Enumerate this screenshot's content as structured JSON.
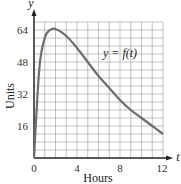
{
  "chart_data": {
    "type": "line",
    "title": "",
    "xlabel": "Hours",
    "ylabel": "Units",
    "x_axis_var": "t",
    "y_axis_var": "y",
    "curve_label": "y = f(t)",
    "xlim": [
      0,
      12
    ],
    "ylim": [
      0,
      64
    ],
    "x_ticks": [
      0,
      4,
      8,
      12
    ],
    "y_ticks": [
      16,
      32,
      48,
      64
    ],
    "grid": true,
    "series": [
      {
        "name": "y = f(t)",
        "x": [
          0,
          0.5,
          1,
          1.5,
          2,
          3,
          4,
          5,
          6,
          7,
          8,
          9,
          10,
          11,
          12
        ],
        "values": [
          0,
          45,
          60,
          64,
          64.5,
          61,
          55,
          48,
          41,
          35,
          29,
          24,
          20,
          16,
          12
        ]
      }
    ]
  },
  "labels": {
    "y_axis_var": "y",
    "x_axis_var": "t",
    "ylabel": "Units",
    "xlabel": "Hours",
    "curve": "y = f(t)",
    "x_ticks": [
      "0",
      "4",
      "8",
      "12"
    ],
    "y_ticks": [
      "16",
      "32",
      "48",
      "64"
    ]
  },
  "colors": {
    "curve": "#6e6e6e",
    "grid": "#9a9a9a",
    "axis": "#222222"
  }
}
